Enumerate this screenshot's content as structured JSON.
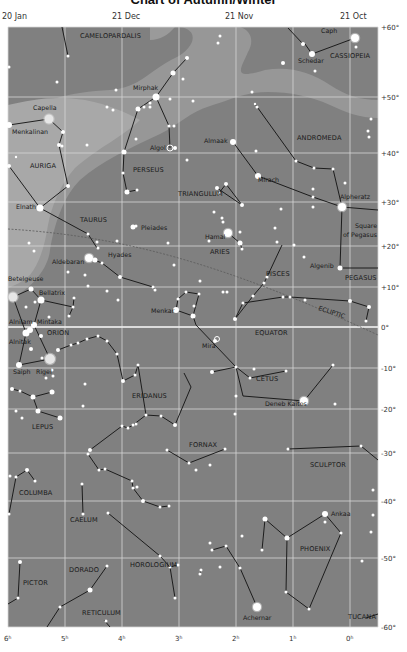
{
  "title": "Chart of Autumn/Winter",
  "colors": {
    "sky": "#808080",
    "milky_way": "#969696",
    "milky_way_light": "#a9a9a9",
    "grid": "#d8d8d8",
    "equator": "#ececec",
    "ecliptic": "#5e5e5e",
    "star": "#ffffff",
    "constellation_line": "#111111",
    "text": "#1a1a1a"
  },
  "date_labels": [
    {
      "text": "20 Jan",
      "x": 2,
      "y": 19
    },
    {
      "text": "21 Dec",
      "x": 112,
      "y": 19
    },
    {
      "text": "21 Nov",
      "x": 225,
      "y": 19
    },
    {
      "text": "21 Oct",
      "x": 340,
      "y": 19
    }
  ],
  "ra_labels": [
    {
      "text": "6h",
      "x": 8
    },
    {
      "text": "5h",
      "x": 65
    },
    {
      "text": "4h",
      "x": 122
    },
    {
      "text": "3h",
      "x": 179
    },
    {
      "text": "2h",
      "x": 236
    },
    {
      "text": "1h",
      "x": 293
    },
    {
      "text": "0h",
      "x": 350
    }
  ],
  "dec_labels": [
    {
      "text": "+60°",
      "y": 27
    },
    {
      "text": "+50°",
      "y": 97
    },
    {
      "text": "+40°",
      "y": 153
    },
    {
      "text": "+30°",
      "y": 202
    },
    {
      "text": "+20°",
      "y": 246
    },
    {
      "text": "+10°",
      "y": 287
    },
    {
      "text": "0°",
      "y": 327
    },
    {
      "text": "-10°",
      "y": 368
    },
    {
      "text": "-20°",
      "y": 409
    },
    {
      "text": "-30°",
      "y": 453
    },
    {
      "text": "-40°",
      "y": 501
    },
    {
      "text": "-50°",
      "y": 558
    },
    {
      "text": "-60°",
      "y": 627
    }
  ],
  "grid": {
    "x_lines": [
      8,
      65,
      122,
      179,
      236,
      293,
      350,
      378
    ],
    "y_lines": [
      27,
      97,
      153,
      202,
      246,
      287,
      327,
      368,
      409,
      453,
      501,
      558,
      627
    ]
  },
  "constellations": [
    {
      "name": "CAMELOPARDALIS",
      "x": 80,
      "y": 38
    },
    {
      "name": "CASSIOPEIA",
      "x": 330,
      "y": 58
    },
    {
      "name": "ANDROMEDA",
      "x": 297,
      "y": 140
    },
    {
      "name": "AURIGA",
      "x": 30,
      "y": 168
    },
    {
      "name": "PERSEUS",
      "x": 133,
      "y": 172
    },
    {
      "name": "TRIANGULUM",
      "x": 178,
      "y": 196
    },
    {
      "name": "TAURUS",
      "x": 80,
      "y": 222
    },
    {
      "name": "ARIES",
      "x": 210,
      "y": 254
    },
    {
      "name": "PISCES",
      "x": 266,
      "y": 276
    },
    {
      "name": "PEGASUS",
      "x": 345,
      "y": 280
    },
    {
      "name": "ORION",
      "x": 47,
      "y": 335
    },
    {
      "name": "EQUATOR",
      "x": 255,
      "y": 335
    },
    {
      "name": "CETUS",
      "x": 256,
      "y": 381
    },
    {
      "name": "ERIDANUS",
      "x": 132,
      "y": 398
    },
    {
      "name": "LEPUS",
      "x": 32,
      "y": 429
    },
    {
      "name": "FORNAX",
      "x": 189,
      "y": 447
    },
    {
      "name": "SCULPTOR",
      "x": 310,
      "y": 467
    },
    {
      "name": "COLUMBA",
      "x": 19,
      "y": 495
    },
    {
      "name": "CAELUM",
      "x": 70,
      "y": 522
    },
    {
      "name": "PHOENIX",
      "x": 300,
      "y": 551
    },
    {
      "name": "HOROLOGIUM",
      "x": 130,
      "y": 567
    },
    {
      "name": "DORADO",
      "x": 69,
      "y": 572
    },
    {
      "name": "PICTOR",
      "x": 23,
      "y": 585
    },
    {
      "name": "RETICULUM",
      "x": 82,
      "y": 615
    },
    {
      "name": "TUCANA",
      "x": 348,
      "y": 619
    }
  ],
  "special_labels": [
    {
      "text": "ECLIPTIC",
      "x": 318,
      "y": 310,
      "rotate": 18
    },
    {
      "text": "Square",
      "x": 355,
      "y": 228
    },
    {
      "text": "of Pegasus",
      "x": 343,
      "y": 237
    }
  ],
  "star_labels": [
    {
      "name": "Caph",
      "x": 321,
      "y": 33
    },
    {
      "name": "Schedar",
      "x": 298,
      "y": 63
    },
    {
      "name": "Mirphak",
      "x": 133,
      "y": 90
    },
    {
      "name": "Capella",
      "x": 33,
      "y": 110
    },
    {
      "name": "Menkalinan",
      "x": 12,
      "y": 134
    },
    {
      "name": "Almaak",
      "x": 204,
      "y": 143
    },
    {
      "name": "Algol",
      "x": 150,
      "y": 150
    },
    {
      "name": "Mirach",
      "x": 258,
      "y": 182
    },
    {
      "name": "Elnath",
      "x": 16,
      "y": 209
    },
    {
      "name": "Alpheratz",
      "x": 340,
      "y": 199
    },
    {
      "name": "Pleiades",
      "x": 141,
      "y": 230
    },
    {
      "name": "Hamal",
      "x": 205,
      "y": 239
    },
    {
      "name": "Aldebaran",
      "x": 52,
      "y": 264
    },
    {
      "name": "Hyades",
      "x": 108,
      "y": 257
    },
    {
      "name": "Algenib",
      "x": 310,
      "y": 268
    },
    {
      "name": "Betelgeuse",
      "x": 8,
      "y": 281
    },
    {
      "name": "Bellatrix",
      "x": 39,
      "y": 295
    },
    {
      "name": "Menkar",
      "x": 151,
      "y": 313
    },
    {
      "name": "Alnilam",
      "x": 9,
      "y": 324
    },
    {
      "name": "Mintaka",
      "x": 37,
      "y": 324
    },
    {
      "name": "Mira",
      "x": 202,
      "y": 348
    },
    {
      "name": "Alnitak",
      "x": 9,
      "y": 344
    },
    {
      "name": "Saiph",
      "x": 13,
      "y": 374
    },
    {
      "name": "Rigel",
      "x": 36,
      "y": 374
    },
    {
      "name": "Deneb Kaitos",
      "x": 265,
      "y": 406
    },
    {
      "name": "Ankaa",
      "x": 331,
      "y": 516
    },
    {
      "name": "Achernar",
      "x": 243,
      "y": 620
    }
  ],
  "stars": [
    [
      355,
      38,
      4
    ],
    [
      303,
      44,
      2
    ],
    [
      312,
      54,
      3
    ],
    [
      356,
      47,
      1.5
    ],
    [
      283,
      63,
      2
    ],
    [
      315,
      71,
      1.5
    ],
    [
      252,
      92,
      1.5
    ],
    [
      257,
      107,
      1.5
    ],
    [
      371,
      119,
      1.5
    ],
    [
      368,
      131,
      1.5
    ],
    [
      369,
      137,
      1.5
    ],
    [
      218,
      43,
      1.5
    ],
    [
      220,
      36,
      1.5
    ],
    [
      348,
      18,
      1.2
    ],
    [
      187,
      58,
      2
    ],
    [
      173,
      73,
      2.5
    ],
    [
      183,
      79,
      1.5
    ],
    [
      156,
      97,
      3.5
    ],
    [
      170,
      99,
      1.5
    ],
    [
      193,
      101,
      1.5
    ],
    [
      138,
      109,
      2.5
    ],
    [
      144,
      107,
      1.5
    ],
    [
      150,
      107,
      1.5
    ],
    [
      150,
      103,
      1.5
    ],
    [
      107,
      107,
      1.5
    ],
    [
      113,
      110,
      1.5
    ],
    [
      116,
      90,
      1.5
    ],
    [
      169,
      126,
      1.5
    ],
    [
      175,
      148,
      2
    ],
    [
      124,
      152,
      2.5
    ],
    [
      136,
      139,
      1.5
    ],
    [
      123,
      173,
      1.5
    ],
    [
      127,
      192,
      2.5
    ],
    [
      137,
      190,
      1.5
    ],
    [
      187,
      160,
      1.5
    ],
    [
      174,
      126,
      1.5
    ],
    [
      49,
      119,
      4.5
    ],
    [
      9,
      125,
      3
    ],
    [
      63,
      132,
      2
    ],
    [
      59,
      145,
      2
    ],
    [
      62,
      146,
      1.5
    ],
    [
      87,
      145,
      1.5
    ],
    [
      68,
      186,
      2
    ],
    [
      9,
      166,
      2
    ],
    [
      16,
      157,
      1.2
    ],
    [
      68,
      56,
      1.5
    ],
    [
      9,
      67,
      1.5
    ],
    [
      40,
      208,
      3.5
    ],
    [
      57,
      82,
      1.5
    ],
    [
      233,
      142,
      3
    ],
    [
      258,
      176,
      3
    ],
    [
      256,
      151,
      1.5
    ],
    [
      296,
      161,
      1.5
    ],
    [
      314,
      168,
      1.5
    ],
    [
      333,
      169,
      1.5
    ],
    [
      313,
      189,
      1.5
    ],
    [
      313,
      197,
      1.5
    ],
    [
      345,
      183,
      1.5
    ],
    [
      313,
      207,
      1.5
    ],
    [
      255,
      104,
      1.2
    ],
    [
      217,
      188,
      2
    ],
    [
      226,
      184,
      2
    ],
    [
      219,
      193,
      1.5
    ],
    [
      242,
      205,
      2
    ],
    [
      281,
      209,
      1.5
    ],
    [
      275,
      228,
      1.5
    ],
    [
      277,
      242,
      1.5
    ],
    [
      294,
      245,
      1.5
    ],
    [
      304,
      257,
      1.5
    ],
    [
      342,
      207,
      4
    ],
    [
      340,
      268,
      2.5
    ],
    [
      240,
      232,
      1.5
    ],
    [
      133,
      227,
      2.5
    ],
    [
      136,
      226,
      1.5
    ],
    [
      88,
      234,
      1.5
    ],
    [
      97,
      242,
      1.5
    ],
    [
      98,
      248,
      1.5
    ],
    [
      117,
      241,
      1.5
    ],
    [
      29,
      243,
      1.5
    ],
    [
      34,
      251,
      1.5
    ],
    [
      89,
      258,
      4
    ],
    [
      95,
      260,
      2.5
    ],
    [
      102,
      263,
      1.5
    ],
    [
      120,
      277,
      2
    ],
    [
      153,
      287,
      1.5
    ],
    [
      155,
      290,
      1.5
    ],
    [
      68,
      272,
      1.5
    ],
    [
      85,
      275,
      1.5
    ],
    [
      88,
      286,
      1.5
    ],
    [
      107,
      291,
      1.5
    ],
    [
      118,
      300,
      1.5
    ],
    [
      174,
      265,
      1.5
    ],
    [
      168,
      243,
      1.5
    ],
    [
      228,
      233,
      4
    ],
    [
      240,
      243,
      2.5
    ],
    [
      242,
      249,
      1.5
    ],
    [
      223,
      222,
      1.5
    ],
    [
      214,
      212,
      1.5
    ],
    [
      222,
      218,
      1.5
    ],
    [
      209,
      241,
      1.5
    ],
    [
      200,
      281,
      1.5
    ],
    [
      13,
      297,
      4.5
    ],
    [
      31,
      289,
      2.5
    ],
    [
      41,
      300,
      3.5
    ],
    [
      35,
      302,
      1.5
    ],
    [
      74,
      298,
      1.5
    ],
    [
      73,
      307,
      1.5
    ],
    [
      26,
      307,
      1.5
    ],
    [
      49,
      317,
      1.5
    ],
    [
      34,
      325,
      3
    ],
    [
      30,
      330,
      3
    ],
    [
      26,
      333,
      3.5
    ],
    [
      69,
      316,
      1.5
    ],
    [
      41,
      336,
      2
    ],
    [
      31,
      349,
      2
    ],
    [
      50,
      359,
      5
    ],
    [
      42,
      358,
      1.5
    ],
    [
      19,
      365,
      3
    ],
    [
      58,
      350,
      2
    ],
    [
      71,
      345,
      1.5
    ],
    [
      78,
      343,
      1.5
    ],
    [
      87,
      339,
      1.5
    ],
    [
      98,
      336,
      1.5
    ],
    [
      107,
      341,
      1.5
    ],
    [
      117,
      354,
      1.5
    ],
    [
      123,
      381,
      2
    ],
    [
      135,
      375,
      1.5
    ],
    [
      138,
      365,
      1.5
    ],
    [
      52,
      370,
      1.5
    ],
    [
      53,
      376,
      1.5
    ],
    [
      46,
      378,
      1.5
    ],
    [
      176,
      310,
      3
    ],
    [
      193,
      316,
      2.5
    ],
    [
      186,
      292,
      1.5
    ],
    [
      199,
      294,
      1.5
    ],
    [
      178,
      299,
      1.5
    ],
    [
      194,
      306,
      1.5
    ],
    [
      215,
      341,
      2
    ],
    [
      235,
      319,
      2
    ],
    [
      243,
      303,
      1.5
    ],
    [
      253,
      296,
      1.5
    ],
    [
      264,
      283,
      1.5
    ],
    [
      267,
      277,
      1.5
    ],
    [
      283,
      297,
      1.5
    ],
    [
      290,
      297,
      1.5
    ],
    [
      305,
      300,
      1.5
    ],
    [
      350,
      301,
      2
    ],
    [
      369,
      307,
      2
    ],
    [
      366,
      321,
      1.5
    ],
    [
      223,
      292,
      1.5
    ],
    [
      227,
      292,
      1.5
    ],
    [
      212,
      372,
      2
    ],
    [
      236,
      367,
      1.5
    ],
    [
      250,
      378,
      1.5
    ],
    [
      254,
      369,
      1.5
    ],
    [
      286,
      371,
      1.5
    ],
    [
      304,
      401,
      4
    ],
    [
      335,
      404,
      1.5
    ],
    [
      236,
      396,
      1.5
    ],
    [
      333,
      365,
      1.5
    ],
    [
      235,
      414,
      1.5
    ],
    [
      12,
      389,
      2
    ],
    [
      20,
      391,
      1.5
    ],
    [
      33,
      397,
      2.5
    ],
    [
      52,
      392,
      2.5
    ],
    [
      38,
      411,
      2.5
    ],
    [
      60,
      418,
      2.5
    ],
    [
      16,
      411,
      1.5
    ],
    [
      22,
      418,
      1.5
    ],
    [
      85,
      384,
      1.5
    ],
    [
      83,
      406,
      1.5
    ],
    [
      122,
      426,
      1.5
    ],
    [
      128,
      428,
      1.5
    ],
    [
      133,
      425,
      1.5
    ],
    [
      146,
      415,
      1.5
    ],
    [
      161,
      416,
      1.5
    ],
    [
      175,
      425,
      2
    ],
    [
      136,
      424,
      1.5
    ],
    [
      90,
      450,
      2
    ],
    [
      88,
      454,
      1.5
    ],
    [
      99,
      470,
      1.5
    ],
    [
      105,
      469,
      1.5
    ],
    [
      132,
      481,
      1.5
    ],
    [
      133,
      488,
      1.5
    ],
    [
      137,
      487,
      1.5
    ],
    [
      143,
      501,
      2
    ],
    [
      160,
      507,
      1.5
    ],
    [
      169,
      506,
      1.5
    ],
    [
      167,
      450,
      1.5
    ],
    [
      189,
      463,
      1.5
    ],
    [
      225,
      449,
      1.5
    ],
    [
      210,
      465,
      1.5
    ],
    [
      196,
      470,
      1.5
    ],
    [
      288,
      449,
      1.5
    ],
    [
      361,
      446,
      1.5
    ],
    [
      373,
      490,
      1.5
    ],
    [
      27,
      470,
      2
    ],
    [
      35,
      481,
      1.5
    ],
    [
      16,
      477,
      1.5
    ],
    [
      10,
      476,
      1.5
    ],
    [
      82,
      484,
      1.5
    ],
    [
      83,
      514,
      1.5
    ],
    [
      9,
      514,
      1.5
    ],
    [
      108,
      513,
      1.5
    ],
    [
      160,
      556,
      1.5
    ],
    [
      170,
      567,
      1.5
    ],
    [
      175,
      598,
      1.5
    ],
    [
      178,
      565,
      1.5
    ],
    [
      20,
      562,
      2
    ],
    [
      18,
      598,
      1.5
    ],
    [
      107,
      566,
      1.5
    ],
    [
      90,
      590,
      2.5
    ],
    [
      60,
      607,
      1.5
    ],
    [
      106,
      621,
      1.5
    ],
    [
      265,
      519,
      2.5
    ],
    [
      262,
      550,
      1.5
    ],
    [
      287,
      538,
      2.5
    ],
    [
      325,
      514,
      3
    ],
    [
      325,
      522,
      1.5
    ],
    [
      341,
      533,
      1.5
    ],
    [
      286,
      592,
      1.5
    ],
    [
      309,
      609,
      1.5
    ],
    [
      226,
      546,
      1.5
    ],
    [
      240,
      568,
      1.5
    ],
    [
      220,
      567,
      1.5
    ],
    [
      210,
      543,
      1.5
    ],
    [
      201,
      570,
      1.5
    ],
    [
      257,
      607,
      4
    ],
    [
      242,
      536,
      1.5
    ],
    [
      373,
      515,
      1.5
    ],
    [
      371,
      532,
      1.5
    ],
    [
      362,
      561,
      1.5
    ],
    [
      212,
      550,
      1.5
    ],
    [
      200,
      574,
      1.5
    ]
  ],
  "special_stars": [
    {
      "name": "Algol",
      "x": 170,
      "y": 148,
      "r": 3,
      "ring": true
    },
    {
      "name": "Mira",
      "x": 217,
      "y": 339,
      "r": 2.5,
      "ring": true
    }
  ],
  "constellation_lines": [
    "M 305 44 L 312 54 L 355 38",
    "M 288 28 L 303 44",
    "M 62 27 L 68 56",
    "M 187 58 L 173 73 L 156 97 L 138 109 L 124 152 L 123 173 L 127 192 L 137 190",
    "M 156 97 L 169 126 L 170 148",
    "M 9 125 L 49 119 L 63 132 L 59 145 L 68 186 L 40 208 L 9 166",
    "M 40 208 L 88 234 L 97 248",
    "M 258 176 L 233 142",
    "M 258 176 L 313 197 L 342 207 L 378 210",
    "M 255 104 L 296 161 L 314 168 L 333 169 L 342 207",
    "M 342 207 L 340 268 L 378 268",
    "M 217 188 L 242 205 L 226 184 L 219 193",
    "M 228 233 L 240 243 L 242 249",
    "M 89 258 L 102 263 L 120 277 L 153 287 L 155 290",
    "M 31 289 L 13 297",
    "M 31 289 L 41 300 L 73 307 L 74 298",
    "M 73 307 L 69 316",
    "M 41 300 L 34 325",
    "M 13 297 L 26 333 L 19 365 L 50 359 L 34 325",
    "M 58 350 L 71 345 L 78 343 L 87 339 L 98 336 L 107 341 L 117 354 L 123 381 L 135 375 L 138 365",
    "M 176 310 L 178 299 L 186 292 L 199 294 L 193 316 L 176 310",
    "M 193 316 L 196 325 L 236 367",
    "M 235 319 L 253 296 L 264 283 L 267 277 L 282 245",
    "M 235 319 L 243 303 L 283 297 L 290 297 L 350 301 L 369 307 L 366 321",
    "M 212 372 L 236 367 L 250 378 L 286 371",
    "M 236 367 L 243 396 L 304 401 L 333 365",
    "M 12 389 L 20 391 L 33 397 L 52 392",
    "M 33 397 L 38 411 L 60 418",
    "M 138 365 L 146 415 L 161 416 L 175 425 L 191 387 L 184 373",
    "M 122 426 L 128 428 L 133 425 L 146 415",
    "M 90 450 L 122 426",
    "M 88 454 L 99 470 L 105 469 L 132 481 L 133 488 L 143 501 L 160 507 L 169 506",
    "M 167 450 L 189 463",
    "M 189 463 L 225 449",
    "M 288 449 L 361 446 L 378 460",
    "M 16 477 L 27 470 L 35 481",
    "M 16 477 L 9 514",
    "M 82 484 L 83 514",
    "M 108 513 L 160 556 L 170 567 L 175 598",
    "M 170 567 L 178 565",
    "M 20 562 L 18 598 L 8 604",
    "M 107 566 L 90 590 L 60 607 L 47 627",
    "M 104 620 L 110 627",
    "M 265 519 L 262 550",
    "M 265 519 L 287 538 L 325 514 L 341 533 L 309 609 L 286 592 L 287 538",
    "M 212 550 L 226 546 L 240 568 L 257 607",
    "M 201 570 L 200 574",
    "M 366 618 L 378 614"
  ]
}
